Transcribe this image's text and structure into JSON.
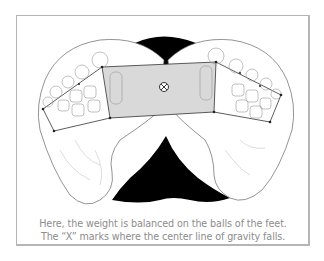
{
  "figure": {
    "caption_lines": [
      "Here, the weight is balanced on the balls of the feet.",
      "The “X” marks where the center line of gravity falls."
    ],
    "marker_label": "X",
    "colors": {
      "frame": "#b5b5b5",
      "caption": "#8c8c8c",
      "shaded_region": "#d9d9d9",
      "shadow": "#000000",
      "outline": "#555555"
    }
  }
}
